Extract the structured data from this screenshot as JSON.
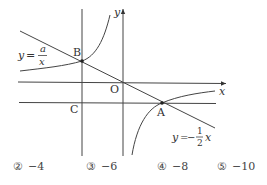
{
  "diagram": {
    "labels": {
      "y_axis": "y",
      "x_axis": "x",
      "origin": "O",
      "point_b": "B",
      "point_a": "A",
      "point_c": "C",
      "curve_lhs": "y",
      "curve_eq": "=",
      "curve_num": "a",
      "curve_den": "x",
      "line_lhs": "y",
      "line_eq": "=",
      "line_minus": "−",
      "line_num": "1",
      "line_den": "2",
      "line_var": "x"
    },
    "colors": {
      "stroke": "#333333",
      "background": "#ffffff"
    }
  },
  "options": [
    {
      "marker": "②",
      "value": "−4"
    },
    {
      "marker": "③",
      "value": "−6"
    },
    {
      "marker": "④",
      "value": "−8"
    },
    {
      "marker": "⑤",
      "value": "−10"
    }
  ]
}
